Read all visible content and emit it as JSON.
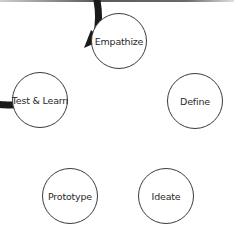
{
  "diagram": {
    "type": "cycle",
    "stages": [
      {
        "label": "Empathize",
        "cx": 119,
        "cy": 41
      },
      {
        "label": "Define",
        "cx": 195,
        "cy": 101
      },
      {
        "label": "Ideate",
        "cx": 166,
        "cy": 196
      },
      {
        "label": "Prototype",
        "cx": 70,
        "cy": 196
      },
      {
        "label": "Test & Learn",
        "cx": 40,
        "cy": 100
      }
    ],
    "arrow_direction": "clockwise, Test & Learn to Empathize",
    "colors": {
      "ring": "#1a1a1a",
      "node_border": "#3a3a3a",
      "node_fill": "#ffffff",
      "text": "#2a2a2a"
    }
  }
}
